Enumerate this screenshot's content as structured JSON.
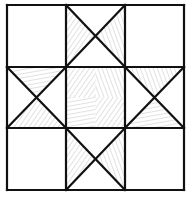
{
  "diagram": {
    "title": "Ohio Star quilt block",
    "grid": {
      "x": [
        7,
        66,
        125,
        184
      ],
      "y": [
        5,
        67,
        128,
        190
      ],
      "line_color": "#111111",
      "line_width": 2.2
    },
    "hatch": {
      "color": "#9a9a9a",
      "line_width": 0.6
    },
    "cells": [
      {
        "row": 0,
        "col": 0,
        "type": "plain"
      },
      {
        "row": 0,
        "col": 1,
        "type": "hourglass",
        "shaded": [
          "left",
          "right"
        ]
      },
      {
        "row": 0,
        "col": 2,
        "type": "plain"
      },
      {
        "row": 1,
        "col": 0,
        "type": "hourglass",
        "shaded": [
          "top",
          "bottom"
        ]
      },
      {
        "row": 1,
        "col": 1,
        "type": "center-shaded"
      },
      {
        "row": 1,
        "col": 2,
        "type": "hourglass",
        "shaded": [
          "top",
          "bottom"
        ]
      },
      {
        "row": 2,
        "col": 0,
        "type": "plain"
      },
      {
        "row": 2,
        "col": 1,
        "type": "hourglass",
        "shaded": [
          "left",
          "right"
        ]
      },
      {
        "row": 2,
        "col": 2,
        "type": "plain"
      }
    ]
  }
}
